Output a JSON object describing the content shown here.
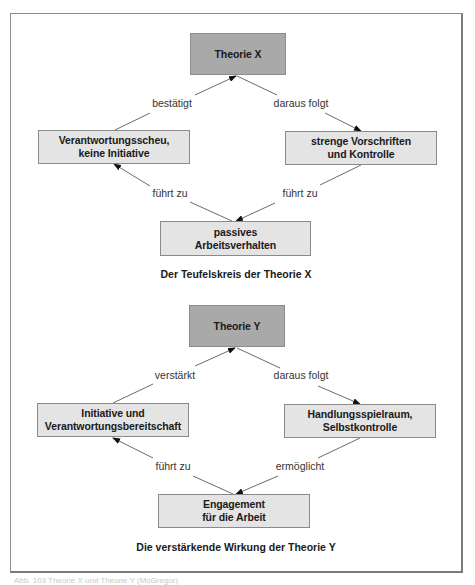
{
  "diagram_x": {
    "top": {
      "label": "Theorie X"
    },
    "left": {
      "line1": "Verantwortungsscheu,",
      "line2": "keine Initiative"
    },
    "right": {
      "line1": "strenge Vorschriften",
      "line2": "und Kontrolle"
    },
    "bottom": {
      "line1": "passives",
      "line2": "Arbeitsverhalten"
    },
    "edges": {
      "left_to_top": "bestätigt",
      "top_to_right": "daraus folgt",
      "bottom_to_left": "führt zu",
      "right_to_bottom": "führt zu"
    },
    "caption": "Der Teufelskreis der Theorie X"
  },
  "diagram_y": {
    "top": {
      "label": "Theorie Y"
    },
    "left": {
      "line1": "Initiative und",
      "line2": "Verantwortungsbereitschaft"
    },
    "right": {
      "line1": "Handlungsspielraum,",
      "line2": "Selbstkontrolle"
    },
    "bottom": {
      "line1": "Engagement",
      "line2": "für die Arbeit"
    },
    "edges": {
      "left_to_top": "verstärkt",
      "top_to_right": "daraus folgt",
      "bottom_to_left": "führt zu",
      "right_to_bottom": "ermöglicht"
    },
    "caption": "Die verstärkende Wirkung der Theorie Y"
  },
  "colors": {
    "top_box": "#a9a9a9",
    "node_box": "#e4e4e4",
    "border": "#8a8a8a"
  },
  "footer": {
    "text": "Abb. 103  Theorie X und Theorie Y (McGregor)"
  }
}
